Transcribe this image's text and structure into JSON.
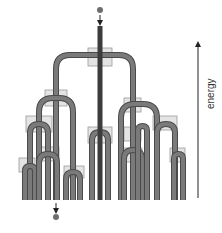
{
  "diagram": {
    "title": "",
    "axis_label": "energy",
    "colors": {
      "tube": "#7a7a7a",
      "tube_edge": "#4a4a4a",
      "active_tube": "#3c3c3c",
      "box_fill": "#e4e4e4",
      "box_stroke": "#9a9a9a",
      "ball": "#6e6e6e",
      "arrow": "#222222"
    },
    "input_particle": {
      "x": 100,
      "y": 10
    },
    "output_particle": {
      "x": 56,
      "y": 217
    },
    "energy_axis": {
      "x": 198,
      "y_top": 40,
      "y_bottom": 198
    },
    "stems": [
      {
        "x": 100,
        "y1": 26,
        "y2": 200,
        "active": true
      }
    ],
    "arches": [
      {
        "cx": 94.5,
        "left": 56,
        "right": 133,
        "top": 55,
        "bottom": 200,
        "active_side": "left"
      },
      {
        "cx": 56,
        "left": 39,
        "right": 73,
        "top": 98,
        "bottom": 200,
        "active_side": "left"
      },
      {
        "cx": 39,
        "left": 30,
        "right": 48,
        "top": 124,
        "bottom": 200,
        "active_side": "right"
      },
      {
        "cx": 30,
        "left": 25,
        "right": 35,
        "top": 166,
        "bottom": 200,
        "active_side": "none"
      },
      {
        "cx": 48,
        "left": 39,
        "right": 57,
        "top": 154,
        "bottom": 200,
        "active_side": "right"
      },
      {
        "cx": 73,
        "left": 66,
        "right": 80,
        "top": 172,
        "bottom": 200,
        "active_side": "none"
      },
      {
        "cx": 100,
        "left": 92,
        "right": 108,
        "top": 132,
        "bottom": 200,
        "active_side": "none"
      },
      {
        "cx": 133,
        "left": 121,
        "right": 157,
        "top": 104,
        "bottom": 200,
        "active_side": "none"
      },
      {
        "cx": 133,
        "left": 124,
        "right": 142,
        "top": 150,
        "bottom": 200,
        "active_side": "none"
      },
      {
        "cx": 142,
        "left": 138,
        "right": 147,
        "top": 126,
        "bottom": 200,
        "active_side": "none"
      },
      {
        "cx": 166,
        "left": 157,
        "right": 175,
        "top": 124,
        "bottom": 200,
        "active_side": "none"
      },
      {
        "cx": 178,
        "left": 174,
        "right": 183,
        "top": 154,
        "bottom": 200,
        "active_side": "none"
      }
    ],
    "boxes": [
      {
        "x": 88,
        "y": 48,
        "w": 24,
        "h": 18
      },
      {
        "x": 45,
        "y": 90,
        "w": 22,
        "h": 16
      },
      {
        "x": 26,
        "y": 116,
        "w": 26,
        "h": 16
      },
      {
        "x": 19,
        "y": 158,
        "w": 16,
        "h": 14
      },
      {
        "x": 37,
        "y": 147,
        "w": 22,
        "h": 14
      },
      {
        "x": 64,
        "y": 166,
        "w": 20,
        "h": 12
      },
      {
        "x": 88,
        "y": 127,
        "w": 24,
        "h": 16
      },
      {
        "x": 124,
        "y": 98,
        "w": 17,
        "h": 14
      },
      {
        "x": 124,
        "y": 127,
        "w": 17,
        "h": 14
      },
      {
        "x": 122,
        "y": 148,
        "w": 20,
        "h": 14
      },
      {
        "x": 153,
        "y": 116,
        "w": 24,
        "h": 14
      },
      {
        "x": 170,
        "y": 148,
        "w": 15,
        "h": 14
      }
    ],
    "bottom_y": 200
  }
}
